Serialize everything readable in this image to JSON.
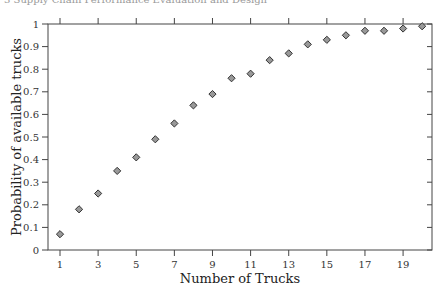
{
  "page": {
    "running_header": "3 Supply Chain Performance Evaluation and Design"
  },
  "chart_data": {
    "type": "scatter",
    "title": "",
    "xlabel": "Number of Trucks",
    "ylabel": "Probability of available trucks",
    "xlim": [
      0.4,
      20.5
    ],
    "ylim": [
      0,
      1
    ],
    "x_ticks": [
      1,
      3,
      5,
      7,
      9,
      11,
      13,
      15,
      17,
      19
    ],
    "y_ticks": [
      0,
      0.1,
      0.2,
      0.3,
      0.4,
      0.5,
      0.6,
      0.7,
      0.8,
      0.9,
      1
    ],
    "y_tick_labels": [
      "0",
      "0.1",
      "0.2",
      "0.3",
      "0.4",
      "0.5",
      "0.6",
      "0.7",
      "0.8",
      "0.9",
      "1"
    ],
    "grid": false,
    "legend": null,
    "marker": "diamond",
    "marker_color": "#999999",
    "marker_edge": "#333333",
    "series": [
      {
        "name": "Probability of available trucks",
        "x": [
          1,
          2,
          3,
          4,
          5,
          6,
          7,
          8,
          9,
          10,
          11,
          12,
          13,
          14,
          15,
          16,
          17,
          18,
          19,
          20
        ],
        "values": [
          0.07,
          0.18,
          0.25,
          0.35,
          0.41,
          0.49,
          0.56,
          0.64,
          0.69,
          0.76,
          0.78,
          0.84,
          0.87,
          0.91,
          0.93,
          0.95,
          0.97,
          0.97,
          0.98,
          0.99
        ]
      }
    ]
  }
}
